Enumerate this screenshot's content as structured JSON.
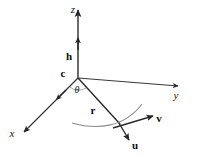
{
  "figure": {
    "kind": "3d-coordinate-vector-diagram",
    "background_color": "#ffffff",
    "stroke_color": "#262626",
    "arc_color": "#6b6b6b",
    "width": 198,
    "height": 156
  },
  "axes": [
    {
      "id": "z",
      "label": "z",
      "label_x": 73,
      "label_y": 13,
      "style": "italic"
    },
    {
      "id": "y",
      "label": "y",
      "label_x": 176,
      "label_y": 99,
      "style": "italic"
    },
    {
      "id": "x",
      "label": "x",
      "label_x": 12,
      "label_y": 137,
      "style": "italic"
    }
  ],
  "points": [
    {
      "id": "c",
      "label": "c",
      "label_x": 63,
      "label_y": 77,
      "style": "bold"
    }
  ],
  "vectors": [
    {
      "id": "h",
      "label": "h",
      "label_x": 69,
      "label_y": 60,
      "style": "bold"
    },
    {
      "id": "r",
      "label": "r",
      "label_x": 93,
      "label_y": 114,
      "style": "bold"
    },
    {
      "id": "v",
      "label": "v",
      "label_x": 159,
      "label_y": 122,
      "style": "bold"
    },
    {
      "id": "u",
      "label": "u",
      "label_x": 135,
      "label_y": 149,
      "style": "bold"
    }
  ],
  "angles": [
    {
      "id": "theta",
      "label": "θ",
      "label_x": 77,
      "label_y": 93,
      "style": "italic"
    }
  ],
  "geometry": {
    "origin": {
      "x": 78,
      "y": 78
    },
    "z_tip": {
      "x": 78,
      "y": 8
    },
    "y_tip": {
      "x": 180,
      "y": 86
    },
    "x_tip": {
      "x": 22,
      "y": 133
    },
    "r_tip": {
      "x": 120,
      "y": 125
    },
    "v_tip": {
      "x": 154,
      "y": 116
    },
    "u_tip": {
      "x": 128,
      "y": 141
    }
  }
}
